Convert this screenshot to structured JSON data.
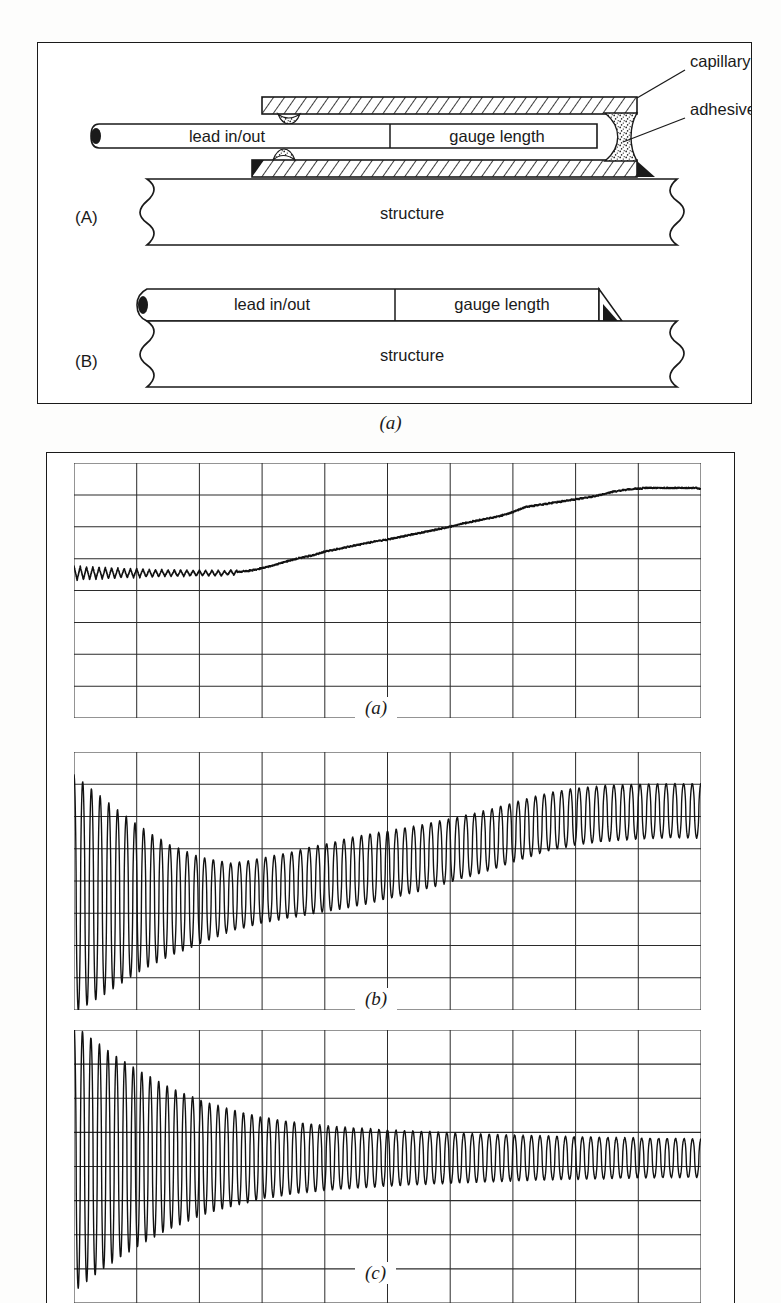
{
  "figure_schematic": {
    "caption": "(a)",
    "panels": [
      {
        "id": "A",
        "label": "(A)",
        "parts": [
          {
            "name": "lead in/out",
            "text": "lead in/out"
          },
          {
            "name": "gauge length",
            "text": "gauge length"
          },
          {
            "name": "structure",
            "text": "structure"
          }
        ]
      },
      {
        "id": "B",
        "label": "(B)",
        "parts": [
          {
            "name": "lead in/out",
            "text": "lead in/out"
          },
          {
            "name": "gauge length",
            "text": "gauge length"
          },
          {
            "name": "structure",
            "text": "structure"
          }
        ]
      }
    ],
    "callouts": [
      {
        "name": "capillary-tube",
        "text": "capillary tube"
      },
      {
        "name": "adhesive",
        "text": "adhesive"
      }
    ],
    "labels": {
      "panel_a": "(A)",
      "panel_b": "(B)",
      "lead_in_out": "lead in/out",
      "gauge_length": "gauge length",
      "structure": "structure",
      "capillary_tube": "capillary tube",
      "adhesive": "adhesive"
    },
    "colors": {
      "line": "#1a1a1a",
      "background": "#ffffff",
      "hatch": "#1a1a1a",
      "stipple": "#333333"
    }
  },
  "figure_traces": {
    "panels": [
      {
        "label": "(a)",
        "name": "trace-a"
      },
      {
        "label": "(b)",
        "name": "trace-b"
      },
      {
        "label": "(c)",
        "name": "trace-c"
      }
    ]
  },
  "chart_data": [
    {
      "type": "line",
      "name": "trace-a",
      "title": "(a)",
      "xlabel": "",
      "ylabel": "",
      "grid": true,
      "grid_columns": 10,
      "grid_rows": 8,
      "xlim": [
        0,
        10
      ],
      "ylim": [
        0,
        8
      ],
      "description": "Oscilloscope trace: staircase ramp rising from mid-low baseline with small ripple at start, stepping up through the middle and flattening near the top right.",
      "baseline": 4.55,
      "series": [
        {
          "name": "ramp-staircase",
          "comment": "y values in graticule divisions (0 = bottom, 8 = top) sampled at even x spacing across 10 divisions",
          "x": [
            0.0,
            0.2,
            0.4,
            0.6,
            0.8,
            1.0,
            1.2,
            1.4,
            1.6,
            1.8,
            2.0,
            2.2,
            2.4,
            2.6,
            2.8,
            3.0,
            3.2,
            3.4,
            3.6,
            3.8,
            4.0,
            4.2,
            4.4,
            4.6,
            4.8,
            5.0,
            5.2,
            5.4,
            5.6,
            5.8,
            6.0,
            6.2,
            6.4,
            6.6,
            6.8,
            7.0,
            7.2,
            7.4,
            7.6,
            7.8,
            8.0,
            8.2,
            8.4,
            8.6,
            8.8,
            9.0,
            9.2,
            9.4,
            9.6,
            9.8,
            10.0
          ],
          "y": [
            4.55,
            4.55,
            4.55,
            4.55,
            4.55,
            4.55,
            4.55,
            4.55,
            4.55,
            4.55,
            4.55,
            4.55,
            4.55,
            4.58,
            4.62,
            4.7,
            4.8,
            4.92,
            5.02,
            5.1,
            5.22,
            5.3,
            5.38,
            5.46,
            5.54,
            5.6,
            5.68,
            5.76,
            5.84,
            5.92,
            6.0,
            6.1,
            6.18,
            6.26,
            6.34,
            6.46,
            6.62,
            6.68,
            6.74,
            6.8,
            6.86,
            6.92,
            7.0,
            7.1,
            7.16,
            7.2,
            7.22,
            7.22,
            7.22,
            7.22,
            7.2
          ],
          "ripple": {
            "start_x": 0.0,
            "end_x": 2.6,
            "amplitude": 0.22,
            "cycles": 26
          }
        }
      ]
    },
    {
      "type": "line",
      "name": "trace-b",
      "title": "(b)",
      "xlabel": "",
      "ylabel": "",
      "grid": true,
      "grid_columns": 10,
      "grid_rows": 8,
      "xlim": [
        0,
        10
      ],
      "ylim": [
        0,
        8
      ],
      "description": "Oscilloscope trace: large-amplitude oscillation at left that decays to a minimum near x=2.5, then the envelope grows again and the mean level rises, settling into a steady oscillation near the top right.",
      "series": [
        {
          "name": "modulated-oscillation",
          "cycles": 72,
          "envelope_x": [
            0.0,
            0.5,
            1.0,
            1.5,
            2.0,
            2.5,
            3.0,
            3.5,
            4.0,
            4.5,
            5.0,
            5.5,
            6.0,
            6.5,
            7.0,
            7.5,
            8.0,
            8.5,
            9.0,
            9.5,
            10.0
          ],
          "envelope_amplitude": [
            3.7,
            3.0,
            2.3,
            1.75,
            1.35,
            1.05,
            1.0,
            1.02,
            1.05,
            1.08,
            1.05,
            1.02,
            0.98,
            0.95,
            0.92,
            0.9,
            0.88,
            0.86,
            0.85,
            0.84,
            0.84
          ],
          "mean_level": [
            3.6,
            3.5,
            3.45,
            3.4,
            3.4,
            3.5,
            3.7,
            3.9,
            4.1,
            4.3,
            4.5,
            4.7,
            4.95,
            5.2,
            5.5,
            5.8,
            6.0,
            6.1,
            6.15,
            6.18,
            6.18
          ]
        }
      ]
    },
    {
      "type": "line",
      "name": "trace-c",
      "title": "(c)",
      "xlabel": "",
      "ylabel": "",
      "grid": true,
      "grid_columns": 10,
      "grid_rows": 8,
      "xlim": [
        0,
        10
      ],
      "ylim": [
        0,
        8
      ],
      "description": "Oscilloscope trace: damped oscillation, very large amplitude at the left decaying monotonically to a small steady ripple about a constant mid-screen baseline at the right.",
      "series": [
        {
          "name": "damped-oscillation",
          "cycles": 74,
          "baseline": 4.25,
          "envelope_x": [
            0.0,
            0.5,
            1.0,
            1.5,
            2.0,
            2.5,
            3.0,
            3.5,
            4.0,
            4.5,
            5.0,
            5.5,
            6.0,
            6.5,
            7.0,
            7.5,
            8.0,
            8.5,
            9.0,
            9.5,
            10.0
          ],
          "envelope_amplitude": [
            3.9,
            3.2,
            2.6,
            2.1,
            1.7,
            1.42,
            1.2,
            1.05,
            0.95,
            0.88,
            0.82,
            0.78,
            0.74,
            0.7,
            0.67,
            0.64,
            0.62,
            0.6,
            0.58,
            0.57,
            0.56
          ]
        }
      ]
    }
  ]
}
